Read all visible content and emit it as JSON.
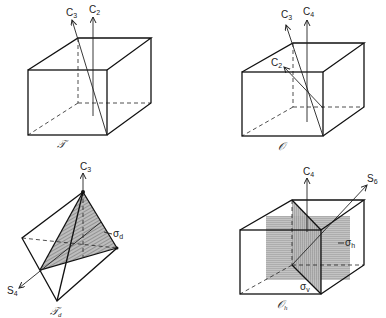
{
  "figure": {
    "panels": [
      {
        "id": "T",
        "name_label": "𝒯",
        "axes": [
          {
            "label": "C",
            "sub": "3"
          },
          {
            "label": "C",
            "sub": "2"
          }
        ]
      },
      {
        "id": "O",
        "name_label": "𝒪",
        "axes": [
          {
            "label": "C",
            "sub": "3"
          },
          {
            "label": "C",
            "sub": "4"
          },
          {
            "label": "C",
            "sub": "2"
          }
        ]
      },
      {
        "id": "Td",
        "name_label": "𝒯",
        "name_sub": "d",
        "axes": [
          {
            "label": "C",
            "sub": "3"
          },
          {
            "label": "S",
            "sub": "4"
          }
        ],
        "planes": [
          {
            "label": "σ",
            "sub": "d"
          }
        ]
      },
      {
        "id": "Oh",
        "name_label": "𝒪",
        "name_sub": "h",
        "axes": [
          {
            "label": "C",
            "sub": "4"
          },
          {
            "label": "S",
            "sub": "6"
          }
        ],
        "planes": [
          {
            "label": "σ",
            "sub": "h"
          },
          {
            "label": "σ",
            "sub": "v"
          }
        ]
      }
    ]
  },
  "colors": {
    "line": "#111111",
    "shade": "#9a9a9a",
    "background": "#ffffff"
  }
}
